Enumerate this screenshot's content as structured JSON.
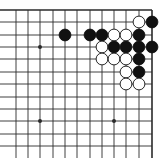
{
  "diagram": {
    "type": "go-board",
    "view": "top-right corner",
    "colors": {
      "background": "#ffffff",
      "line": "#2a2a2a",
      "black": "#111111",
      "white": "#ffffff"
    },
    "grid": {
      "x": [
        16,
        28,
        40,
        53,
        65,
        77,
        90,
        102,
        114,
        126,
        139,
        152
      ],
      "y": [
        10,
        22,
        35,
        47,
        59,
        72,
        84,
        97,
        109,
        121,
        134,
        146
      ],
      "edge_right": true,
      "edge_top": true
    },
    "star_points": [
      {
        "col": 2,
        "row": 3
      },
      {
        "col": 2,
        "row": 9
      },
      {
        "col": 8,
        "row": 9
      }
    ],
    "stones": [
      {
        "color": "white",
        "col": 10,
        "row": 1
      },
      {
        "color": "black",
        "col": 11,
        "row": 1
      },
      {
        "color": "black",
        "col": 4,
        "row": 2
      },
      {
        "color": "black",
        "col": 6,
        "row": 2
      },
      {
        "color": "black",
        "col": 7,
        "row": 2
      },
      {
        "color": "white",
        "col": 8,
        "row": 2
      },
      {
        "color": "white",
        "col": 9,
        "row": 2
      },
      {
        "color": "black",
        "col": 10,
        "row": 2
      },
      {
        "color": "white",
        "col": 7,
        "row": 3
      },
      {
        "color": "black",
        "col": 8,
        "row": 3
      },
      {
        "color": "black",
        "col": 9,
        "row": 3
      },
      {
        "color": "black",
        "col": 10,
        "row": 3
      },
      {
        "color": "black",
        "col": 11,
        "row": 3
      },
      {
        "color": "white",
        "col": 7,
        "row": 4
      },
      {
        "color": "white",
        "col": 8,
        "row": 4
      },
      {
        "color": "white",
        "col": 9,
        "row": 4
      },
      {
        "color": "black",
        "col": 10,
        "row": 4
      },
      {
        "color": "white",
        "col": 9,
        "row": 5
      },
      {
        "color": "black",
        "col": 10,
        "row": 5
      },
      {
        "color": "white",
        "col": 9,
        "row": 6
      },
      {
        "color": "white",
        "col": 10,
        "row": 6
      }
    ]
  }
}
